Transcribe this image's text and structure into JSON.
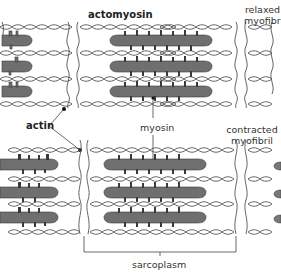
{
  "diagram": {
    "labels": {
      "actomyosin": "actomyosin",
      "relaxed_line1": "relaxed",
      "relaxed_line2": "myofibril",
      "actin": "actin",
      "myosin": "myosin",
      "contracted_line1": "contracted",
      "contracted_line2": "myofibril",
      "sarcoplasm": "sarcoplasm"
    },
    "panels": [
      {
        "name": "relaxed myofibril",
        "position": "top",
        "myosin_filaments": 3
      },
      {
        "name": "contracted myofibril",
        "position": "bottom",
        "myosin_filaments": 3
      }
    ],
    "colors": {
      "myosin_fill": "#6f6f6f",
      "myosin_dark": "#3a3a3a",
      "actin_stroke": "#444444",
      "line": "#555555",
      "text": "#333333"
    }
  }
}
